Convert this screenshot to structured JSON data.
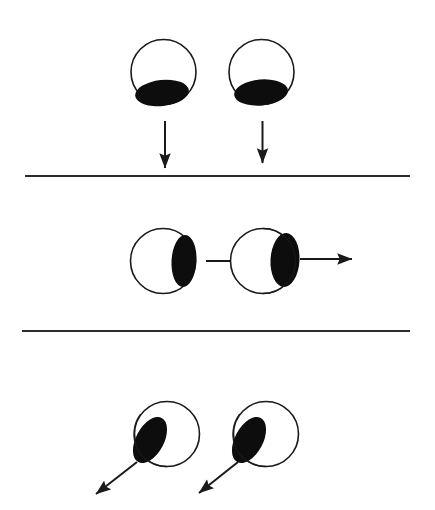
{
  "figure": {
    "canvas": {
      "width": 435,
      "height": 510,
      "background": "#ffffff"
    },
    "colors": {
      "outline": "#1a1a1a",
      "fill_dark": "#0d0d0d",
      "body_fill": "#ffffff",
      "divider": "#2b2b2b",
      "arrow": "#1a1a1a"
    },
    "stroke_widths": {
      "circle_outline": 1.6,
      "divider": 2.0,
      "arrow_shaft": 2.0
    }
  },
  "panels": [
    {
      "id": "panel-top",
      "name": "top-panel",
      "label": "downward motion",
      "objects": [
        {
          "id": "circle-top-left",
          "name": "circle-top-left",
          "cx": 163.5,
          "cy": 72.0,
          "r": 32.5,
          "inclusion": {
            "name": "dark-region-bottom",
            "cx": 162.0,
            "cy": 93.0,
            "rx": 27.0,
            "ry": 13.0,
            "rotation": -6,
            "position": "bottom"
          }
        },
        {
          "id": "circle-top-right",
          "name": "circle-top-right",
          "cx": 261.5,
          "cy": 72.0,
          "r": 32.5,
          "inclusion": {
            "name": "dark-region-bottom",
            "cx": 261.0,
            "cy": 92.5,
            "rx": 27.0,
            "ry": 13.0,
            "rotation": -5,
            "position": "bottom"
          }
        }
      ],
      "arrows": [
        {
          "id": "arrow-down-left",
          "name": "arrow-down-left",
          "direction": "down",
          "x1": 165.0,
          "y1": 121.0,
          "x2": 165.0,
          "y2": 168.0
        },
        {
          "id": "arrow-down-right",
          "name": "arrow-down-right",
          "direction": "down",
          "x1": 262.5,
          "y1": 121.0,
          "x2": 262.5,
          "y2": 163.0
        }
      ]
    },
    {
      "id": "panel-middle",
      "name": "middle-panel",
      "label": "rightward motion",
      "objects": [
        {
          "id": "circle-mid-left",
          "name": "circle-mid-left",
          "cx": 163.0,
          "cy": 261.0,
          "r": 32.5,
          "inclusion": {
            "name": "dark-region-right",
            "cx": 184.0,
            "cy": 261.0,
            "rx": 12.5,
            "ry": 26.0,
            "rotation": 3,
            "position": "right"
          }
        },
        {
          "id": "circle-mid-right",
          "name": "circle-mid-right",
          "cx": 263.0,
          "cy": 261.0,
          "r": 32.5,
          "inclusion": {
            "name": "dark-region-right",
            "cx": 285.0,
            "cy": 260.0,
            "rx": 14.5,
            "ry": 27.0,
            "rotation": 3,
            "position": "right-overhang"
          }
        }
      ],
      "arrows": [
        {
          "id": "arrow-right-middle",
          "name": "arrow-right-middle",
          "direction": "right",
          "x1": 206.0,
          "y1": 261.0,
          "x2": 256.0,
          "y2": 261.0
        },
        {
          "id": "arrow-right-end",
          "name": "arrow-right-end",
          "direction": "right",
          "x1": 300.0,
          "y1": 259.0,
          "x2": 352.0,
          "y2": 259.0
        }
      ]
    },
    {
      "id": "panel-bottom",
      "name": "bottom-panel",
      "label": "diagonal down-left motion",
      "objects": [
        {
          "id": "circle-bottom-left",
          "name": "circle-bottom-left",
          "cx": 167.0,
          "cy": 434.0,
          "r": 32.5,
          "inclusion": {
            "name": "dark-region-left-tilted",
            "cx": 150.0,
            "cy": 440.0,
            "rx": 14.0,
            "ry": 25.0,
            "rotation": 28,
            "position": "upper-left"
          }
        },
        {
          "id": "circle-bottom-right",
          "name": "circle-bottom-right",
          "cx": 266.0,
          "cy": 434.0,
          "r": 32.5,
          "inclusion": {
            "name": "dark-region-left-tilted",
            "cx": 249.0,
            "cy": 440.0,
            "rx": 14.0,
            "ry": 25.0,
            "rotation": 28,
            "position": "upper-left"
          }
        }
      ],
      "arrows": [
        {
          "id": "arrow-diagonal-left",
          "name": "arrow-diagonal-left",
          "direction": "down-left",
          "x1": 137.0,
          "y1": 462.0,
          "x2": 96.0,
          "y2": 494.0
        },
        {
          "id": "arrow-diagonal-right",
          "name": "arrow-diagonal-right",
          "direction": "down-left",
          "x1": 238.0,
          "y1": 462.0,
          "x2": 199.0,
          "y2": 493.0
        }
      ]
    }
  ],
  "dividers": [
    {
      "id": "divider-upper",
      "name": "divider-upper",
      "x1": 25.0,
      "y1": 176.0,
      "x2": 410.0,
      "y2": 176.0
    },
    {
      "id": "divider-lower",
      "name": "divider-lower",
      "x1": 22.0,
      "y1": 331.0,
      "x2": 410.0,
      "y2": 331.0
    }
  ]
}
